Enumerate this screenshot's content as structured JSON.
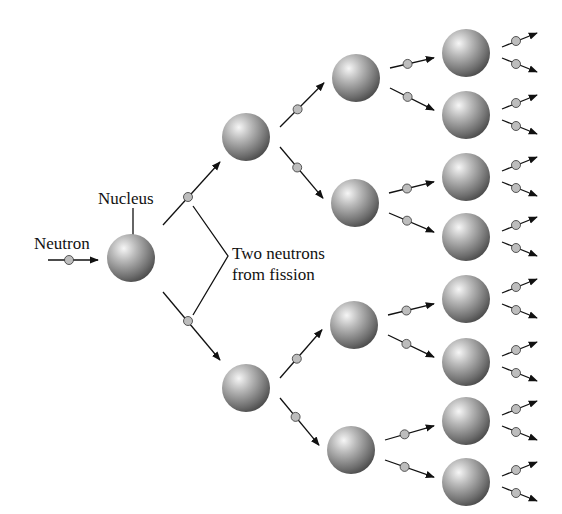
{
  "labels": {
    "neutron": "Neutron",
    "nucleus": "Nucleus",
    "fission_line1": "Two neutrons",
    "fission_line2": "from fission"
  },
  "colors": {
    "nucleus_light": "#f4f4f4",
    "nucleus_mid": "#9a9a9a",
    "nucleus_dark": "#4a4a4a",
    "neutron_fill": "#bdbdbd",
    "line": "#111111"
  },
  "generations": [
    {
      "gen": 0,
      "nuclei": [
        [
          131,
          258
        ]
      ]
    },
    {
      "gen": 1,
      "nuclei": [
        [
          246,
          137
        ],
        [
          246,
          388
        ]
      ]
    },
    {
      "gen": 2,
      "nuclei": [
        [
          356,
          78
        ],
        [
          355,
          203
        ],
        [
          354,
          325
        ],
        [
          351,
          450
        ]
      ]
    },
    {
      "gen": 3,
      "nuclei": [
        [
          466,
          53
        ],
        [
          466,
          115
        ],
        [
          466,
          177
        ],
        [
          466,
          237
        ],
        [
          466,
          299
        ],
        [
          466,
          362
        ],
        [
          466,
          421
        ],
        [
          466,
          482
        ]
      ]
    }
  ]
}
